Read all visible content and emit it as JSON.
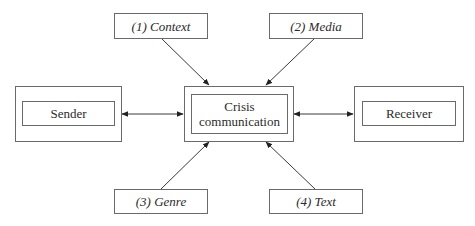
{
  "diagram": {
    "nodes": {
      "sender": {
        "label": "Sender"
      },
      "center": {
        "label": "Crisis communication",
        "line1": "Crisis",
        "line2": "communication"
      },
      "receiver": {
        "label": "Receiver"
      },
      "context": {
        "label": "(1) Context"
      },
      "media": {
        "label": "(2) Media"
      },
      "genre": {
        "label": "(3) Genre"
      },
      "text": {
        "label": "(4) Text"
      }
    },
    "edges": [
      {
        "from": "sender",
        "to": "center",
        "type": "bidirectional"
      },
      {
        "from": "center",
        "to": "receiver",
        "type": "bidirectional"
      },
      {
        "from": "context",
        "to": "center",
        "type": "directed"
      },
      {
        "from": "media",
        "to": "center",
        "type": "directed"
      },
      {
        "from": "genre",
        "to": "center",
        "type": "directed"
      },
      {
        "from": "text",
        "to": "center",
        "type": "directed"
      }
    ],
    "colors": {
      "line": "#3a3a3a",
      "border": "#6a6a6a",
      "text": "#2b2b2b"
    }
  }
}
